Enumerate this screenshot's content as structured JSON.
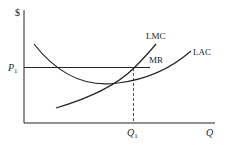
{
  "diagram": {
    "type": "economics-cost-curves",
    "y_axis_label": "$",
    "x_axis_label": "Q",
    "price_label": "P",
    "price_subscript": "1",
    "quantity_label": "Q",
    "quantity_subscript": "1",
    "curves": [
      {
        "name": "LMC",
        "label": "LMC",
        "description": "Long-run marginal cost, upward sloping"
      },
      {
        "name": "LAC",
        "label": "LAC",
        "description": "Long-run average cost, U-shaped"
      },
      {
        "name": "MR",
        "label": "MR",
        "description": "Marginal revenue, horizontal at P1"
      }
    ],
    "colors": {
      "line": "#222222",
      "background": "#ffffff"
    }
  }
}
